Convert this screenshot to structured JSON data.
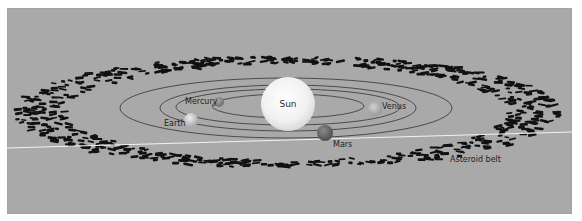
{
  "diagram": {
    "type": "solar-system-illustration",
    "background_color": "#a9a9a9",
    "sun": {
      "label": "Sun",
      "color": "#f4f4f4"
    },
    "planets": [
      {
        "name": "Mercury",
        "label": "Mercury",
        "color": "#8f8f8f"
      },
      {
        "name": "Venus",
        "label": "Venus",
        "color": "#bdbdbd"
      },
      {
        "name": "Earth",
        "label": "Earth",
        "color": "#d4d4d4"
      },
      {
        "name": "Mars",
        "label": "Mars",
        "color": "#6f6f6f"
      }
    ],
    "asteroid_belt": {
      "label": "Asteroid belt",
      "color": "#111111"
    },
    "orbit_count": 4,
    "orbit_color": "#3f3f3f",
    "horizon_line_color": "#f2f2f2"
  }
}
